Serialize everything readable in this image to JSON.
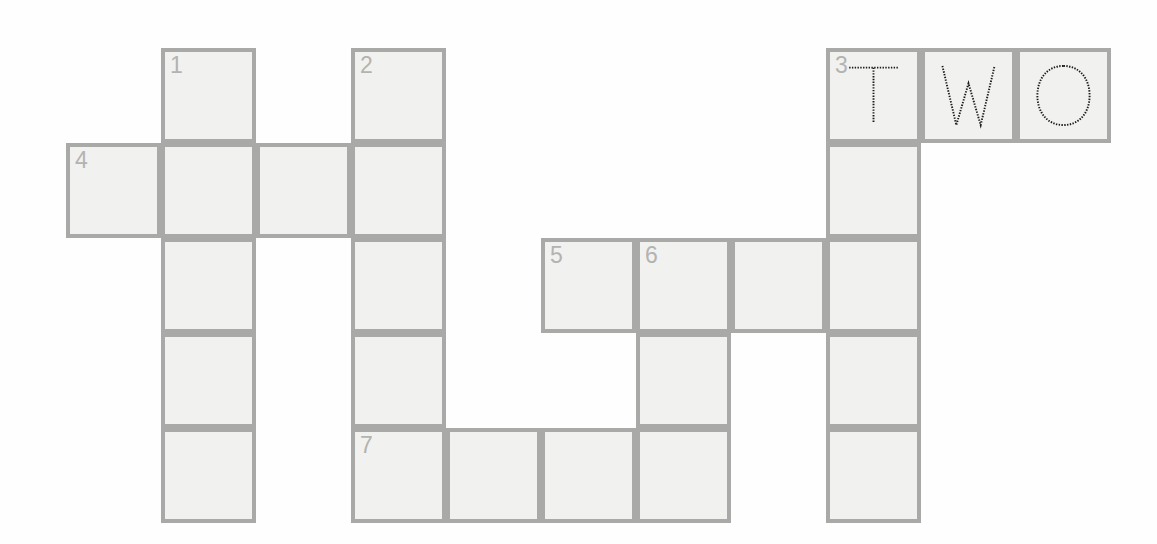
{
  "puzzle": {
    "title": "Crossword Puzzle Grid",
    "cell_size": 95,
    "origin_x": 66,
    "origin_y": 48,
    "colors": {
      "background": "#fefefe",
      "cell_fill": "#f1f1ef",
      "cell_border": "#a9a9a7",
      "clue_number": "#b3b3b1",
      "letter_ink": "#1b1b1b"
    },
    "cells": [
      {
        "row": 0,
        "col": 1,
        "number": "1",
        "letter": ""
      },
      {
        "row": 0,
        "col": 3,
        "number": "2",
        "letter": ""
      },
      {
        "row": 0,
        "col": 8,
        "number": "3",
        "letter": "T"
      },
      {
        "row": 0,
        "col": 9,
        "number": "",
        "letter": "W"
      },
      {
        "row": 0,
        "col": 10,
        "number": "",
        "letter": "O"
      },
      {
        "row": 1,
        "col": 0,
        "number": "4",
        "letter": ""
      },
      {
        "row": 1,
        "col": 1,
        "number": "",
        "letter": ""
      },
      {
        "row": 1,
        "col": 2,
        "number": "",
        "letter": ""
      },
      {
        "row": 1,
        "col": 3,
        "number": "",
        "letter": ""
      },
      {
        "row": 1,
        "col": 8,
        "number": "",
        "letter": ""
      },
      {
        "row": 2,
        "col": 1,
        "number": "",
        "letter": ""
      },
      {
        "row": 2,
        "col": 3,
        "number": "",
        "letter": ""
      },
      {
        "row": 2,
        "col": 5,
        "number": "5",
        "letter": ""
      },
      {
        "row": 2,
        "col": 6,
        "number": "6",
        "letter": ""
      },
      {
        "row": 2,
        "col": 7,
        "number": "",
        "letter": ""
      },
      {
        "row": 2,
        "col": 8,
        "number": "",
        "letter": ""
      },
      {
        "row": 3,
        "col": 1,
        "number": "",
        "letter": ""
      },
      {
        "row": 3,
        "col": 3,
        "number": "",
        "letter": ""
      },
      {
        "row": 3,
        "col": 6,
        "number": "",
        "letter": ""
      },
      {
        "row": 3,
        "col": 8,
        "number": "",
        "letter": ""
      },
      {
        "row": 4,
        "col": 1,
        "number": "",
        "letter": ""
      },
      {
        "row": 4,
        "col": 3,
        "number": "7",
        "letter": ""
      },
      {
        "row": 4,
        "col": 4,
        "number": "",
        "letter": ""
      },
      {
        "row": 4,
        "col": 5,
        "number": "",
        "letter": ""
      },
      {
        "row": 4,
        "col": 6,
        "number": "",
        "letter": ""
      },
      {
        "row": 4,
        "col": 8,
        "number": "",
        "letter": ""
      }
    ],
    "filled_answers": [
      {
        "number": "3",
        "direction": "across",
        "text": "TWO",
        "row": 0,
        "col": 8
      }
    ],
    "clue_numbers_visible": [
      "1",
      "2",
      "3",
      "4",
      "5",
      "6",
      "7"
    ]
  }
}
